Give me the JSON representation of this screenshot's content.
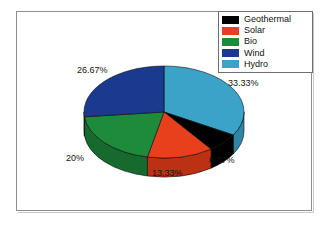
{
  "chart_data": {
    "type": "pie",
    "title": "",
    "subtitle": "",
    "xlabel": "",
    "ylabel": "",
    "three_d": true,
    "grid": false,
    "legend_position": "top-right",
    "categories": [
      "Geothermal",
      "Solar",
      "Bio",
      "Wind",
      "Hydro"
    ],
    "values": [
      6.67,
      13.33,
      20,
      26.67,
      33.33
    ],
    "value_unit": "%",
    "data_labels": [
      "6.67%",
      "13.33%",
      "20%",
      "26.67%",
      "33.33%"
    ],
    "colors": [
      "#000000",
      "#E8401C",
      "#1E8B3C",
      "#1A3A8F",
      "#3BA3C8"
    ],
    "slices": [
      {
        "name": "Hydro",
        "value": 33.33,
        "label": "33.33%",
        "color": "#3BA3C8",
        "side_color": "#2E86A6",
        "start_angle": 0,
        "end_angle": 120.0
      },
      {
        "name": "Geothermal",
        "value": 6.67,
        "label": "6.67%",
        "color": "#000000",
        "side_color": "#000000",
        "start_angle": 120.0,
        "end_angle": 144.0
      },
      {
        "name": "Solar",
        "value": 13.33,
        "label": "13.33%",
        "color": "#E8401C",
        "side_color": "#BC3013",
        "start_angle": 144.0,
        "end_angle": 192.0
      },
      {
        "name": "Bio",
        "value": 20.0,
        "label": "20%",
        "color": "#1E8B3C",
        "side_color": "#166A2D",
        "start_angle": 192.0,
        "end_angle": 264.0
      },
      {
        "name": "Wind",
        "value": 26.67,
        "label": "26.67%",
        "color": "#1A3A8F",
        "side_color": "#132B6B",
        "start_angle": 264.0,
        "end_angle": 360.0
      }
    ]
  },
  "legend": {
    "items": [
      {
        "label": "Geothermal",
        "color": "#000000"
      },
      {
        "label": "Solar",
        "color": "#E8401C"
      },
      {
        "label": "Bio",
        "color": "#1E8B3C"
      },
      {
        "label": "Wind",
        "color": "#1A3A8F"
      },
      {
        "label": "Hydro",
        "color": "#3BA3C8"
      }
    ]
  },
  "labels": {
    "hydro": "33.33%",
    "geothermal": "6.67%",
    "solar": "13.33%",
    "bio": "20%",
    "wind": "26.67%"
  },
  "colors": {
    "background": "#ffffff",
    "frame": "#8c8c94",
    "text": "#141414"
  }
}
